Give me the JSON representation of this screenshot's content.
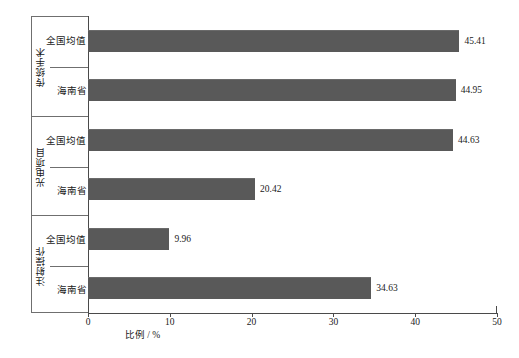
{
  "chart_data": {
    "type": "bar",
    "orientation": "horizontal",
    "title": "",
    "xlabel": "比例 / %",
    "ylabel": "",
    "xlim": [
      0,
      50
    ],
    "xticks": [
      0,
      10,
      20,
      30,
      40,
      50
    ],
    "xtick_labels": [
      "0",
      "10",
      "20",
      "30",
      "40",
      "50"
    ],
    "grid": false,
    "legend": null,
    "bar_color": "#595959",
    "groups": [
      {
        "group_label": "传统手术",
        "categories": [
          "全国均值",
          "海南省"
        ],
        "values": [
          45.41,
          44.95
        ],
        "value_labels": [
          "45.41",
          "44.95"
        ]
      },
      {
        "group_label": "光电项目",
        "categories": [
          "全国均值",
          "海南省"
        ],
        "values": [
          44.63,
          20.42
        ],
        "value_labels": [
          "44.63",
          "20.42"
        ]
      },
      {
        "group_label": "注射操作",
        "categories": [
          "全国均值",
          "海南省"
        ],
        "values": [
          9.96,
          34.63
        ],
        "value_labels": [
          "9.96",
          "34.63"
        ]
      }
    ],
    "categories": [
      "传统手术 - 全国均值",
      "传统手术 - 海南省",
      "光电项目 - 全国均值",
      "光电项目 - 海南省",
      "注射操作 - 全国均值",
      "注射操作 - 海南省"
    ],
    "values": [
      45.41,
      44.95,
      44.63,
      20.42,
      9.96,
      34.63
    ]
  }
}
